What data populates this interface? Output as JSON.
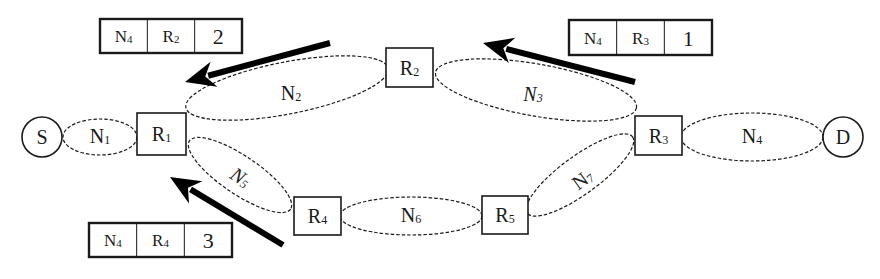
{
  "diagram": {
    "colors": {
      "stroke": "#1a1a1a",
      "background": "#ffffff",
      "arrow": "#000000"
    },
    "endpoints": [
      {
        "id": "S",
        "label": "S",
        "cx": 42,
        "cy": 137,
        "r": 20
      },
      {
        "id": "D",
        "label": "D",
        "cx": 843,
        "cy": 137,
        "r": 20
      }
    ],
    "routers": [
      {
        "id": "R1",
        "base": "R",
        "sub": "1",
        "x": 137,
        "y": 113,
        "w": 49,
        "h": 42
      },
      {
        "id": "R2",
        "base": "R",
        "sub": "2",
        "x": 386,
        "y": 48,
        "w": 47,
        "h": 39
      },
      {
        "id": "R3",
        "base": "R",
        "sub": "3",
        "x": 635,
        "y": 116,
        "w": 47,
        "h": 39
      },
      {
        "id": "R4",
        "base": "R",
        "sub": "4",
        "x": 294,
        "y": 197,
        "w": 47,
        "h": 38
      },
      {
        "id": "R5",
        "base": "R",
        "sub": "5",
        "x": 482,
        "y": 196,
        "w": 46,
        "h": 38
      }
    ],
    "networks": [
      {
        "id": "N1",
        "base": "N",
        "sub": "1",
        "italic": false,
        "cx": 100,
        "cy": 137,
        "rx": 37,
        "ry": 18,
        "rot": 0,
        "lx": 100,
        "ly": 143
      },
      {
        "id": "N2",
        "base": "N",
        "sub": "2",
        "italic": false,
        "cx": 287,
        "cy": 88,
        "rx": 103,
        "ry": 26,
        "rot": -11,
        "lx": 291,
        "ly": 100
      },
      {
        "id": "N3",
        "base": "N",
        "sub": "3",
        "italic": true,
        "cx": 536,
        "cy": 90,
        "rx": 102,
        "ry": 26,
        "rot": 10,
        "lx": 533,
        "ly": 101
      },
      {
        "id": "N4",
        "base": "N",
        "sub": "4",
        "italic": false,
        "cx": 752,
        "cy": 137,
        "rx": 71,
        "ry": 24,
        "rot": 0,
        "lx": 752,
        "ly": 143
      },
      {
        "id": "N5",
        "base": "N",
        "sub": "5",
        "italic": true,
        "cx": 240,
        "cy": 175,
        "rx": 61,
        "ry": 19,
        "rot": 34,
        "lx": 240,
        "ly": 184
      },
      {
        "id": "N6",
        "base": "N",
        "sub": "6",
        "italic": false,
        "cx": 411,
        "cy": 216,
        "rx": 71,
        "ry": 19,
        "rot": 0,
        "lx": 411,
        "ly": 222
      },
      {
        "id": "N7",
        "base": "N",
        "sub": "7",
        "italic": false,
        "cx": 580,
        "cy": 175,
        "rx": 65,
        "ry": 19,
        "rot": -36,
        "lx": 583,
        "ly": 186
      }
    ],
    "routing_tables": [
      {
        "id": "table-r2",
        "x": 100,
        "y": 19,
        "w": 142,
        "h": 34,
        "cells": [
          {
            "base": "N",
            "sub": "4"
          },
          {
            "base": "R",
            "sub": "2"
          },
          {
            "base": "2",
            "sub": ""
          }
        ]
      },
      {
        "id": "table-r3",
        "x": 569,
        "y": 20,
        "w": 143,
        "h": 35,
        "cells": [
          {
            "base": "N",
            "sub": "4"
          },
          {
            "base": "R",
            "sub": "3"
          },
          {
            "base": "1",
            "sub": ""
          }
        ]
      },
      {
        "id": "table-r4",
        "x": 89,
        "y": 223,
        "w": 143,
        "h": 34,
        "cells": [
          {
            "base": "N",
            "sub": "4"
          },
          {
            "base": "R",
            "sub": "4"
          },
          {
            "base": "3",
            "sub": ""
          }
        ]
      }
    ],
    "arrows": [
      {
        "id": "arrow-r2-to-r1",
        "x1": 330,
        "y1": 43,
        "x2": 185,
        "y2": 82
      },
      {
        "id": "arrow-r3-to-r2",
        "x1": 635,
        "y1": 82,
        "x2": 483,
        "y2": 43
      },
      {
        "id": "arrow-r4-to-r1",
        "x1": 283,
        "y1": 245,
        "x2": 170,
        "y2": 177
      }
    ]
  }
}
